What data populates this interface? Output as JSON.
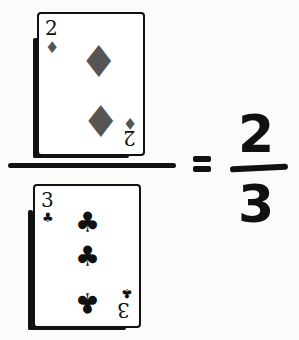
{
  "numerator_card": {
    "rank": "2",
    "suit": "diamonds",
    "suit_glyph": "♦",
    "suit_color": "#555555"
  },
  "denominator_card": {
    "rank": "3",
    "suit": "clubs",
    "suit_glyph": "♣",
    "suit_color": "#111111"
  },
  "equals": "=",
  "result": {
    "numerator": "2",
    "denominator": "3"
  }
}
